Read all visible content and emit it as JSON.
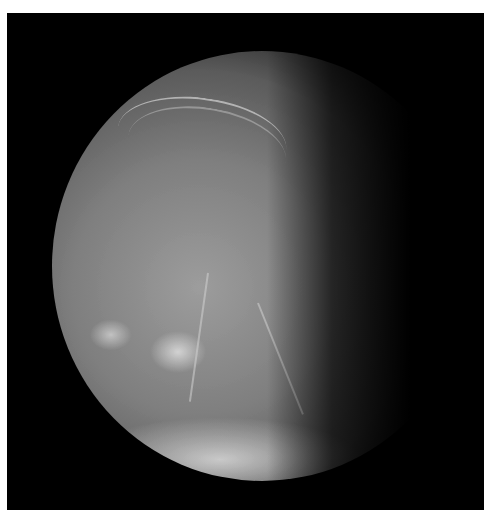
{
  "image": {
    "subject": "Cratered icy moon, partially illuminated (crescent/gibbous phase) against black space",
    "background_color": "#000000",
    "frame_color": "#ffffff",
    "surface_colors": [
      "#9a9a9a",
      "#7f7f7f",
      "#5e5e5e",
      "#e6e6e6"
    ]
  }
}
